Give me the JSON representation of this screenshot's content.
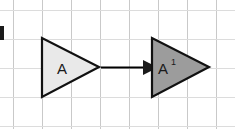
{
  "figure": {
    "background_color": "#ffffff",
    "width": 235,
    "height": 129,
    "grid": {
      "spacing": 29,
      "color": "#c9c9c9",
      "faint_color": "#dcdcdc",
      "vertical_x": [
        13,
        42,
        71,
        100,
        129,
        158,
        187,
        216
      ],
      "horizontal_y": [
        10,
        39,
        68,
        97,
        126
      ]
    },
    "corner_mark": {
      "name": "figure-edge-marker",
      "color": "#1b1b1b",
      "x": 0,
      "y": 26,
      "width": 4,
      "height": 14
    },
    "shapes": [
      {
        "id": "triangle-a",
        "label": "A",
        "prime": "",
        "fill": "#e9e9e9",
        "stroke": "#111111",
        "points": "42,38 42,97 99,67",
        "label_x": 58,
        "label_y": 73
      },
      {
        "id": "triangle-a-prime",
        "label": "A",
        "prime": "1",
        "fill": "#9c9c9c",
        "stroke": "#111111",
        "points": "152,38 152,97 209,67",
        "label_x": 159,
        "label_y": 73,
        "prime_x": 171,
        "prime_y": 64
      }
    ],
    "arrow": {
      "name": "translation-arrow",
      "color": "#000000",
      "x1": 101,
      "y1": 67,
      "x2": 144,
      "y2": 67,
      "head_points": "144,60 158,67 144,74"
    }
  }
}
